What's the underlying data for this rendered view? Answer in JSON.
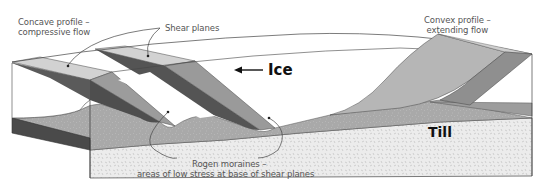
{
  "diagram": {
    "type": "block-diagram",
    "labels": {
      "concave_line1": "Concave profile –",
      "concave_line2": "compressive flow",
      "shear_planes": "Shear planes",
      "convex_line1": "Convex profile –",
      "convex_line2": "extending flow",
      "ice": "Ice",
      "till": "Till",
      "rogen_line1": "Rogen moraines –",
      "rogen_line2": "areas of low stress at base of shear planes"
    },
    "ice_flow_direction": "right-to-left",
    "colors": {
      "ice_top": "#ffffff",
      "shear_light": "#c8c8c8",
      "shear_mid": "#9a9a9a",
      "shear_dark": "#555555",
      "convex_face": "#b4b4b4",
      "debris": "#a8a8a8",
      "till": "#ebebeb",
      "outline": "#444444",
      "label_text": "#555555",
      "bold_text": "#111111"
    }
  }
}
